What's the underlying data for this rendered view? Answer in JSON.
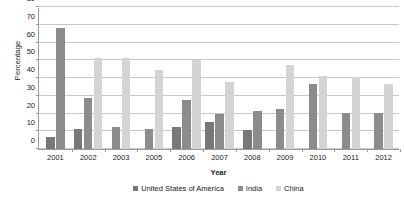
{
  "chart_data": {
    "type": "bar",
    "title": "",
    "xlabel": "Year",
    "ylabel": "Percentage",
    "categories": [
      "2001",
      "2002",
      "2003",
      "2005",
      "2006",
      "2007",
      "2008",
      "2009",
      "2010",
      "2011",
      "2012"
    ],
    "series": [
      {
        "name": "United States of America",
        "color": "#787878",
        "values": [
          7,
          11,
          null,
          null,
          12.5,
          15.5,
          10.5,
          null,
          null,
          null,
          null
        ]
      },
      {
        "name": "India",
        "color": "#8c8c8c",
        "values": [
          68,
          29,
          12.5,
          11,
          27.5,
          19.5,
          21.5,
          22.5,
          36.5,
          20.5,
          20.5
        ]
      },
      {
        "name": "China",
        "color": "#d4d4d4",
        "values": [
          null,
          51,
          51,
          44.5,
          50,
          37.5,
          null,
          47.5,
          41,
          40.5,
          36.5
        ]
      }
    ],
    "ylim": [
      0,
      80
    ],
    "yticks": [
      0,
      10,
      20,
      30,
      40,
      50,
      60,
      70,
      80
    ],
    "ytick_labels": [
      "0",
      "10",
      "20",
      "30",
      "40",
      "50",
      "60",
      "70",
      "80"
    ],
    "grid": true,
    "legend_position": "bottom"
  },
  "colors": {
    "usa": "#787878",
    "india": "#8c8c8c",
    "china": "#d4d4d4",
    "gridline": "#c9c9c9",
    "axis": "#9a9a9a",
    "text": "#1a1a1a",
    "background": "#ffffff"
  }
}
